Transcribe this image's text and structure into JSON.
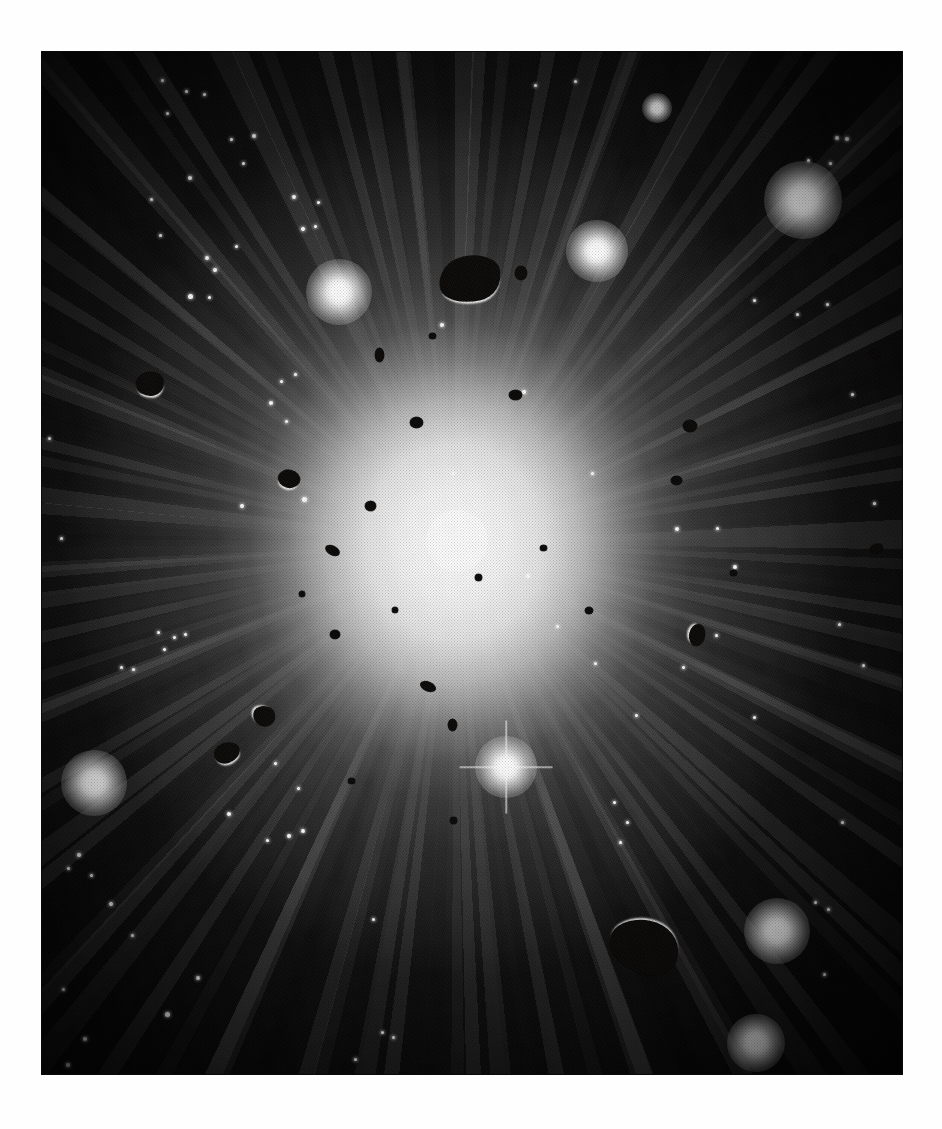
{
  "page": {
    "background_color": "#ffffff",
    "caption": ""
  },
  "plate": {
    "name": "halftone-astronomical-plate",
    "left": 42,
    "top": 52,
    "width": 860,
    "height": 1022,
    "background_color": "#060606",
    "description": "Printed halftone illustration of a brilliant central light source radiating spoke-like rays through a dusty cloud, surrounded by dark irregular rock fragments and glowing stars."
  },
  "scene": {
    "center_x_pct": 48,
    "center_y_pct": 48,
    "glow_color": "#ffffff",
    "void_color": "#060606",
    "rock_color": "#0a0807",
    "ray_count": 25
  },
  "core": {
    "name": "central-light-source",
    "x_pct": 48.2,
    "y_pct": 47.8,
    "size": 62,
    "label": "central bright disc"
  },
  "stars": [
    {
      "name": "star-glow-upper-right-large",
      "x_pct": 88.5,
      "y_pct": 14.5,
      "size": 78
    },
    {
      "name": "star-glow-upper-mid-right",
      "x_pct": 64.5,
      "y_pct": 19.5,
      "size": 62
    },
    {
      "name": "star-glow-upper-left",
      "x_pct": 34.5,
      "y_pct": 23.5,
      "size": 66
    },
    {
      "name": "star-glow-lower-left",
      "x_pct": 6.0,
      "y_pct": 71.5,
      "size": 66
    },
    {
      "name": "star-glow-lower-center",
      "x_pct": 54.0,
      "y_pct": 70.0,
      "size": 62,
      "spiked": true
    },
    {
      "name": "star-glow-lower-right",
      "x_pct": 85.5,
      "y_pct": 86.0,
      "size": 66
    },
    {
      "name": "star-glow-bottom-right",
      "x_pct": 83.0,
      "y_pct": 97.0,
      "size": 58
    },
    {
      "name": "star-glow-top-small",
      "x_pct": 71.5,
      "y_pct": 5.5,
      "size": 30
    }
  ],
  "star_points": [
    {
      "x_pct": 14.0,
      "y_pct": 2.8,
      "size": 3
    },
    {
      "x_pct": 16.8,
      "y_pct": 3.9,
      "size": 3
    },
    {
      "x_pct": 18.9,
      "y_pct": 4.2,
      "size": 3
    },
    {
      "x_pct": 14.6,
      "y_pct": 6.0,
      "size": 3
    },
    {
      "x_pct": 22.0,
      "y_pct": 8.6,
      "size": 3
    },
    {
      "x_pct": 24.7,
      "y_pct": 8.2,
      "size": 4
    },
    {
      "x_pct": 23.4,
      "y_pct": 10.9,
      "size": 3
    },
    {
      "x_pct": 17.2,
      "y_pct": 12.3,
      "size": 4
    },
    {
      "x_pct": 12.7,
      "y_pct": 14.4,
      "size": 3
    },
    {
      "x_pct": 13.8,
      "y_pct": 18.0,
      "size": 3
    },
    {
      "x_pct": 29.3,
      "y_pct": 14.2,
      "size": 4
    },
    {
      "x_pct": 32.1,
      "y_pct": 14.7,
      "size": 3
    },
    {
      "x_pct": 30.4,
      "y_pct": 17.3,
      "size": 4
    },
    {
      "x_pct": 31.8,
      "y_pct": 17.1,
      "size": 3
    },
    {
      "x_pct": 22.6,
      "y_pct": 19.0,
      "size": 3
    },
    {
      "x_pct": 19.2,
      "y_pct": 20.2,
      "size": 4
    },
    {
      "x_pct": 20.1,
      "y_pct": 21.3,
      "size": 4
    },
    {
      "x_pct": 17.3,
      "y_pct": 23.9,
      "size": 5
    },
    {
      "x_pct": 19.5,
      "y_pct": 24.0,
      "size": 3
    },
    {
      "x_pct": 92.4,
      "y_pct": 8.4,
      "size": 4
    },
    {
      "x_pct": 93.6,
      "y_pct": 8.5,
      "size": 4
    },
    {
      "x_pct": 89.1,
      "y_pct": 10.6,
      "size": 3
    },
    {
      "x_pct": 91.7,
      "y_pct": 10.9,
      "size": 3
    },
    {
      "x_pct": 0.9,
      "y_pct": 37.8,
      "size": 3
    },
    {
      "x_pct": 2.3,
      "y_pct": 47.6,
      "size": 3
    },
    {
      "x_pct": 27.8,
      "y_pct": 32.2,
      "size": 3
    },
    {
      "x_pct": 29.5,
      "y_pct": 31.6,
      "size": 3
    },
    {
      "x_pct": 26.6,
      "y_pct": 34.3,
      "size": 4
    },
    {
      "x_pct": 28.4,
      "y_pct": 36.2,
      "size": 3
    },
    {
      "x_pct": 23.2,
      "y_pct": 44.4,
      "size": 4
    },
    {
      "x_pct": 30.5,
      "y_pct": 43.8,
      "size": 5
    },
    {
      "x_pct": 82.9,
      "y_pct": 24.3,
      "size": 3
    },
    {
      "x_pct": 87.8,
      "y_pct": 25.7,
      "size": 3
    },
    {
      "x_pct": 91.3,
      "y_pct": 24.7,
      "size": 3
    },
    {
      "x_pct": 94.3,
      "y_pct": 33.5,
      "size": 3
    },
    {
      "x_pct": 96.8,
      "y_pct": 44.2,
      "size": 3
    },
    {
      "x_pct": 73.8,
      "y_pct": 46.7,
      "size": 4
    },
    {
      "x_pct": 78.6,
      "y_pct": 46.6,
      "size": 3
    },
    {
      "x_pct": 80.6,
      "y_pct": 50.4,
      "size": 4
    },
    {
      "x_pct": 56.5,
      "y_pct": 51.3,
      "size": 4
    },
    {
      "x_pct": 47.9,
      "y_pct": 41.2,
      "size": 3
    },
    {
      "x_pct": 92.7,
      "y_pct": 56.0,
      "size": 3
    },
    {
      "x_pct": 95.5,
      "y_pct": 60.0,
      "size": 3
    },
    {
      "x_pct": 66.6,
      "y_pct": 73.4,
      "size": 3
    },
    {
      "x_pct": 68.1,
      "y_pct": 75.4,
      "size": 3
    },
    {
      "x_pct": 67.3,
      "y_pct": 77.3,
      "size": 3
    },
    {
      "x_pct": 69.1,
      "y_pct": 64.9,
      "size": 3
    },
    {
      "x_pct": 93.1,
      "y_pct": 75.4,
      "size": 3
    },
    {
      "x_pct": 13.6,
      "y_pct": 56.8,
      "size": 3
    },
    {
      "x_pct": 15.4,
      "y_pct": 57.3,
      "size": 3
    },
    {
      "x_pct": 16.7,
      "y_pct": 57.0,
      "size": 3
    },
    {
      "x_pct": 14.2,
      "y_pct": 58.5,
      "size": 3
    },
    {
      "x_pct": 9.3,
      "y_pct": 60.2,
      "size": 3
    },
    {
      "x_pct": 10.6,
      "y_pct": 60.4,
      "size": 3
    },
    {
      "x_pct": 27.2,
      "y_pct": 69.6,
      "size": 3
    },
    {
      "x_pct": 29.8,
      "y_pct": 72.1,
      "size": 3
    },
    {
      "x_pct": 21.7,
      "y_pct": 74.6,
      "size": 4
    },
    {
      "x_pct": 28.7,
      "y_pct": 76.7,
      "size": 4
    },
    {
      "x_pct": 30.4,
      "y_pct": 76.2,
      "size": 4
    },
    {
      "x_pct": 26.2,
      "y_pct": 77.2,
      "size": 3
    },
    {
      "x_pct": 4.3,
      "y_pct": 78.6,
      "size": 4
    },
    {
      "x_pct": 3.1,
      "y_pct": 79.9,
      "size": 3
    },
    {
      "x_pct": 5.8,
      "y_pct": 80.6,
      "size": 3
    },
    {
      "x_pct": 8.0,
      "y_pct": 83.4,
      "size": 4
    },
    {
      "x_pct": 10.5,
      "y_pct": 86.4,
      "size": 3
    },
    {
      "x_pct": 18.1,
      "y_pct": 90.6,
      "size": 4
    },
    {
      "x_pct": 2.5,
      "y_pct": 91.7,
      "size": 3
    },
    {
      "x_pct": 14.6,
      "y_pct": 94.2,
      "size": 5
    },
    {
      "x_pct": 5.0,
      "y_pct": 96.6,
      "size": 4
    },
    {
      "x_pct": 3.0,
      "y_pct": 99.1,
      "size": 4
    },
    {
      "x_pct": 39.6,
      "y_pct": 95.9,
      "size": 3
    },
    {
      "x_pct": 40.9,
      "y_pct": 96.4,
      "size": 3
    },
    {
      "x_pct": 38.5,
      "y_pct": 84.9,
      "size": 3
    },
    {
      "x_pct": 36.5,
      "y_pct": 98.6,
      "size": 3
    },
    {
      "x_pct": 89.9,
      "y_pct": 83.2,
      "size": 3
    },
    {
      "x_pct": 91.5,
      "y_pct": 83.9,
      "size": 3
    },
    {
      "x_pct": 91.0,
      "y_pct": 90.3,
      "size": 3
    },
    {
      "x_pct": 82.8,
      "y_pct": 65.1,
      "size": 3
    },
    {
      "x_pct": 74.6,
      "y_pct": 60.2,
      "size": 3
    },
    {
      "x_pct": 78.4,
      "y_pct": 57.1,
      "size": 3
    },
    {
      "x_pct": 57.4,
      "y_pct": 3.3,
      "size": 3
    },
    {
      "x_pct": 62.0,
      "y_pct": 2.9,
      "size": 3
    },
    {
      "x_pct": 59.9,
      "y_pct": 56.2,
      "size": 3
    },
    {
      "x_pct": 64.4,
      "y_pct": 59.8,
      "size": 3
    },
    {
      "x_pct": 64.0,
      "y_pct": 41.2,
      "size": 3
    },
    {
      "x_pct": 46.5,
      "y_pct": 26.7,
      "size": 4
    },
    {
      "x_pct": 56.0,
      "y_pct": 33.3,
      "size": 4
    }
  ],
  "rocks": [
    {
      "name": "rock-top-center-large",
      "x_pct": 49.8,
      "y_pct": 22.2,
      "w": 62,
      "h": 46,
      "rot": -12,
      "lit": "lit-b",
      "radius": "46% 54% 40% 60% / 58% 44% 56% 42%"
    },
    {
      "name": "rock-bottom-center-large",
      "x_pct": 70.0,
      "y_pct": 87.6,
      "w": 70,
      "h": 54,
      "rot": 10,
      "lit": "lit-t",
      "radius": "52% 48% 38% 62% / 44% 56% 44% 56%"
    },
    {
      "name": "rock-left-mid",
      "x_pct": 12.5,
      "y_pct": 32.5,
      "w": 28,
      "h": 24,
      "rot": -8,
      "lit": "lit-b",
      "radius": "50% 50% 44% 56% / 52% 48% 52% 48%"
    },
    {
      "name": "rock-left-lower",
      "x_pct": 25.8,
      "y_pct": 65.0,
      "w": 22,
      "h": 20,
      "rot": 18,
      "lit": "lit-l",
      "radius": "56% 44% 50% 50% / 46% 54% 46% 54%"
    },
    {
      "name": "rock-left-lower2",
      "x_pct": 21.5,
      "y_pct": 68.6,
      "w": 26,
      "h": 20,
      "rot": -20,
      "lit": "lit-b",
      "radius": "48% 52% 56% 44% / 50% 50% 50% 50%"
    },
    {
      "name": "rock-center-left-small",
      "x_pct": 28.7,
      "y_pct": 41.8,
      "w": 22,
      "h": 18,
      "rot": 14,
      "lit": "lit-b",
      "radius": "50% 50% 50% 50% / 54% 46% 54% 46%"
    },
    {
      "name": "rock-center-upper",
      "x_pct": 43.6,
      "y_pct": 36.3,
      "w": 13,
      "h": 11,
      "rot": 0,
      "lit": "none",
      "radius": "50% 50% 50% 50% / 50% 50% 50% 50%"
    },
    {
      "name": "rock-center-small-a",
      "x_pct": 38.2,
      "y_pct": 44.4,
      "w": 11,
      "h": 10,
      "rot": 0,
      "lit": "none",
      "radius": "52% 48% 48% 52% / 50% 50% 50% 50%"
    },
    {
      "name": "rock-center-small-b",
      "x_pct": 33.8,
      "y_pct": 48.8,
      "w": 15,
      "h": 9,
      "rot": 28,
      "lit": "none",
      "radius": "52% 48% 48% 52% / 50% 50% 50% 50%"
    },
    {
      "name": "rock-center-small-c",
      "x_pct": 34.1,
      "y_pct": 57.0,
      "w": 10,
      "h": 9,
      "rot": 0,
      "lit": "none",
      "radius": "50% 50% 50% 50% / 50% 50% 50% 50%"
    },
    {
      "name": "rock-center-small-d",
      "x_pct": 44.9,
      "y_pct": 62.1,
      "w": 16,
      "h": 9,
      "rot": 22,
      "lit": "none",
      "radius": "50% 50% 50% 50% / 50% 50% 50% 50%"
    },
    {
      "name": "rock-center-small-e",
      "x_pct": 47.7,
      "y_pct": 65.9,
      "w": 9,
      "h": 12,
      "rot": 0,
      "lit": "none",
      "radius": "50% 50% 50% 50% / 50% 50% 50% 50%"
    },
    {
      "name": "rock-center-small-f",
      "x_pct": 55.0,
      "y_pct": 33.6,
      "w": 13,
      "h": 10,
      "rot": 0,
      "lit": "none",
      "radius": "50% 50% 50% 50% / 50% 50% 50% 50%"
    },
    {
      "name": "rock-center-small-g",
      "x_pct": 55.7,
      "y_pct": 21.6,
      "w": 12,
      "h": 14,
      "rot": 0,
      "lit": "none",
      "radius": "50% 50% 50% 50% / 50% 50% 50% 50%"
    },
    {
      "name": "rock-center-small-h",
      "x_pct": 39.2,
      "y_pct": 29.6,
      "w": 9,
      "h": 14,
      "rot": 0,
      "lit": "none",
      "radius": "50% 50% 50% 50% / 50% 50% 50% 50%"
    },
    {
      "name": "rock-right-mid",
      "x_pct": 75.3,
      "y_pct": 36.6,
      "w": 14,
      "h": 12,
      "rot": 0,
      "lit": "none",
      "radius": "50% 50% 50% 50% / 50% 50% 50% 50%"
    },
    {
      "name": "rock-right-lower",
      "x_pct": 76.2,
      "y_pct": 57.0,
      "w": 16,
      "h": 22,
      "rot": 10,
      "lit": "lit-l",
      "radius": "50% 50% 50% 50% / 50% 50% 50% 50%"
    },
    {
      "name": "rock-right-upper",
      "x_pct": 73.8,
      "y_pct": 41.9,
      "w": 11,
      "h": 9,
      "rot": 0,
      "lit": "none",
      "radius": "50% 50% 50% 50% / 50% 50% 50% 50%"
    },
    {
      "name": "rock-upper-right-edge",
      "x_pct": 92.0,
      "y_pct": 20.3,
      "w": 9,
      "h": 9,
      "rot": 0,
      "lit": "none",
      "radius": "50% 50% 50% 50% / 50% 50% 50% 50%"
    },
    {
      "name": "rock-right-small",
      "x_pct": 96.8,
      "y_pct": 29.5,
      "w": 11,
      "h": 9,
      "rot": 20,
      "lit": "none",
      "radius": "50% 50% 50% 50% / 50% 50% 50% 50%"
    },
    {
      "name": "rock-right-small2",
      "x_pct": 97.0,
      "y_pct": 48.6,
      "w": 13,
      "h": 9,
      "rot": -20,
      "lit": "none",
      "radius": "50% 50% 50% 50% / 50% 50% 50% 50%"
    },
    {
      "name": "rock-center-dot-a",
      "x_pct": 50.8,
      "y_pct": 51.4,
      "w": 7,
      "h": 7,
      "rot": 0,
      "lit": "none",
      "radius": "50%"
    },
    {
      "name": "rock-center-dot-b",
      "x_pct": 58.3,
      "y_pct": 48.5,
      "w": 7,
      "h": 6,
      "rot": 0,
      "lit": "none",
      "radius": "50%"
    },
    {
      "name": "rock-center-dot-c",
      "x_pct": 41.0,
      "y_pct": 54.6,
      "w": 6,
      "h": 6,
      "rot": 0,
      "lit": "none",
      "radius": "50%"
    },
    {
      "name": "rock-center-dot-d",
      "x_pct": 30.2,
      "y_pct": 53.0,
      "w": 6,
      "h": 6,
      "rot": 0,
      "lit": "none",
      "radius": "50%"
    },
    {
      "name": "rock-center-dot-e",
      "x_pct": 63.6,
      "y_pct": 54.6,
      "w": 8,
      "h": 7,
      "rot": 0,
      "lit": "none",
      "radius": "50%"
    },
    {
      "name": "rock-center-dot-f",
      "x_pct": 36.0,
      "y_pct": 71.3,
      "w": 7,
      "h": 6,
      "rot": 0,
      "lit": "none",
      "radius": "50%"
    },
    {
      "name": "rock-center-dot-g",
      "x_pct": 47.8,
      "y_pct": 75.2,
      "w": 7,
      "h": 7,
      "rot": 0,
      "lit": "none",
      "radius": "50%"
    },
    {
      "name": "rock-upper-mid-dot",
      "x_pct": 45.4,
      "y_pct": 27.8,
      "w": 7,
      "h": 6,
      "rot": 0,
      "lit": "none",
      "radius": "50%"
    },
    {
      "name": "rock-lower-right-dot",
      "x_pct": 80.4,
      "y_pct": 51.0,
      "w": 7,
      "h": 6,
      "rot": 0,
      "lit": "none",
      "radius": "50%"
    }
  ]
}
